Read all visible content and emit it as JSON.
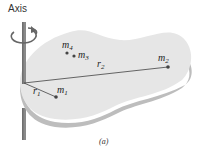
{
  "diagram": {
    "axis_label": "Axis",
    "caption": "(a)",
    "masses": [
      {
        "name": "m",
        "sub": "1"
      },
      {
        "name": "m",
        "sub": "2"
      },
      {
        "name": "m",
        "sub": "3"
      },
      {
        "name": "m",
        "sub": "4"
      }
    ],
    "radii": [
      {
        "name": "r",
        "sub": "1"
      },
      {
        "name": "r",
        "sub": "2"
      }
    ],
    "colors": {
      "body_top": "#e6e6e6",
      "body_edge": "#bdbdbd",
      "axis_rod": "#8a8a8a",
      "line": "#555555",
      "dot": "#444444"
    }
  }
}
